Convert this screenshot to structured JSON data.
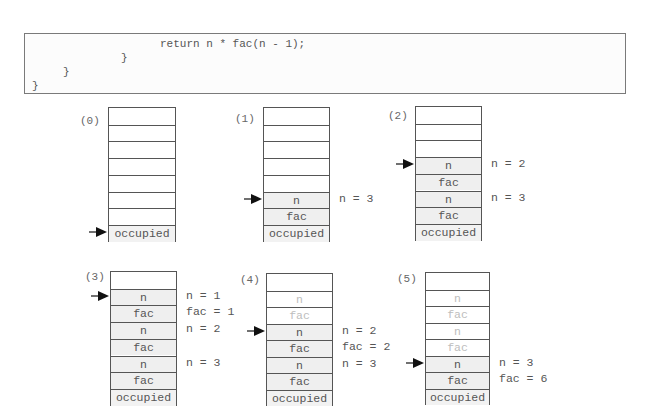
{
  "code": {
    "lines": [
      "return n * fac(n - 1);",
      "}",
      "}",
      "}"
    ]
  },
  "stacks": [
    {
      "label": "(0)",
      "cells": [
        {
          "text": "",
          "state": "empty"
        },
        {
          "text": "",
          "state": "empty"
        },
        {
          "text": "",
          "state": "empty"
        },
        {
          "text": "",
          "state": "empty"
        },
        {
          "text": "",
          "state": "empty"
        },
        {
          "text": "",
          "state": "empty"
        },
        {
          "text": "",
          "state": "empty"
        },
        {
          "text": "occupied",
          "state": "occupied"
        }
      ],
      "pointer_row": 7,
      "annotations": []
    },
    {
      "label": "(1)",
      "cells": [
        {
          "text": "",
          "state": "empty"
        },
        {
          "text": "",
          "state": "empty"
        },
        {
          "text": "",
          "state": "empty"
        },
        {
          "text": "",
          "state": "empty"
        },
        {
          "text": "",
          "state": "empty"
        },
        {
          "text": "n",
          "state": "active"
        },
        {
          "text": "fac",
          "state": "active"
        },
        {
          "text": "occupied",
          "state": "occupied"
        }
      ],
      "pointer_row": 5,
      "annotations": [
        {
          "row": 5,
          "text": "n = 3"
        }
      ]
    },
    {
      "label": "(2)",
      "cells": [
        {
          "text": "",
          "state": "empty"
        },
        {
          "text": "",
          "state": "empty"
        },
        {
          "text": "",
          "state": "empty"
        },
        {
          "text": "n",
          "state": "active"
        },
        {
          "text": "fac",
          "state": "active"
        },
        {
          "text": "n",
          "state": "active"
        },
        {
          "text": "fac",
          "state": "active"
        },
        {
          "text": "occupied",
          "state": "occupied"
        }
      ],
      "pointer_row": 3,
      "annotations": [
        {
          "row": 3,
          "text": "n = 2"
        },
        {
          "row": 5,
          "text": "n = 3"
        }
      ]
    },
    {
      "label": "(3)",
      "cells": [
        {
          "text": "",
          "state": "empty"
        },
        {
          "text": "n",
          "state": "active"
        },
        {
          "text": "fac",
          "state": "active"
        },
        {
          "text": "n",
          "state": "active"
        },
        {
          "text": "fac",
          "state": "active"
        },
        {
          "text": "n",
          "state": "active"
        },
        {
          "text": "fac",
          "state": "active"
        },
        {
          "text": "occupied",
          "state": "occupied"
        }
      ],
      "pointer_row": 1,
      "annotations": [
        {
          "row": 1,
          "text": "n = 1"
        },
        {
          "row": 2,
          "text": "fac = 1"
        },
        {
          "row": 3,
          "text": "n = 2"
        },
        {
          "row": 5,
          "text": "n = 3"
        }
      ]
    },
    {
      "label": "(4)",
      "cells": [
        {
          "text": "",
          "state": "empty"
        },
        {
          "text": "n",
          "state": "stale"
        },
        {
          "text": "fac",
          "state": "stale"
        },
        {
          "text": "n",
          "state": "active"
        },
        {
          "text": "fac",
          "state": "active"
        },
        {
          "text": "n",
          "state": "active"
        },
        {
          "text": "fac",
          "state": "active"
        },
        {
          "text": "occupied",
          "state": "occupied"
        }
      ],
      "pointer_row": 3,
      "annotations": [
        {
          "row": 3,
          "text": "n = 2"
        },
        {
          "row": 4,
          "text": "fac = 2"
        },
        {
          "row": 5,
          "text": "n = 3"
        }
      ]
    },
    {
      "label": "(5)",
      "cells": [
        {
          "text": "",
          "state": "empty"
        },
        {
          "text": "n",
          "state": "stale"
        },
        {
          "text": "fac",
          "state": "stale"
        },
        {
          "text": "n",
          "state": "stale"
        },
        {
          "text": "fac",
          "state": "stale"
        },
        {
          "text": "n",
          "state": "active"
        },
        {
          "text": "fac",
          "state": "active"
        },
        {
          "text": "occupied",
          "state": "occupied"
        }
      ],
      "pointer_row": 5,
      "annotations": [
        {
          "row": 5,
          "text": "n = 3"
        },
        {
          "row": 6,
          "text": "fac = 6"
        }
      ]
    }
  ]
}
